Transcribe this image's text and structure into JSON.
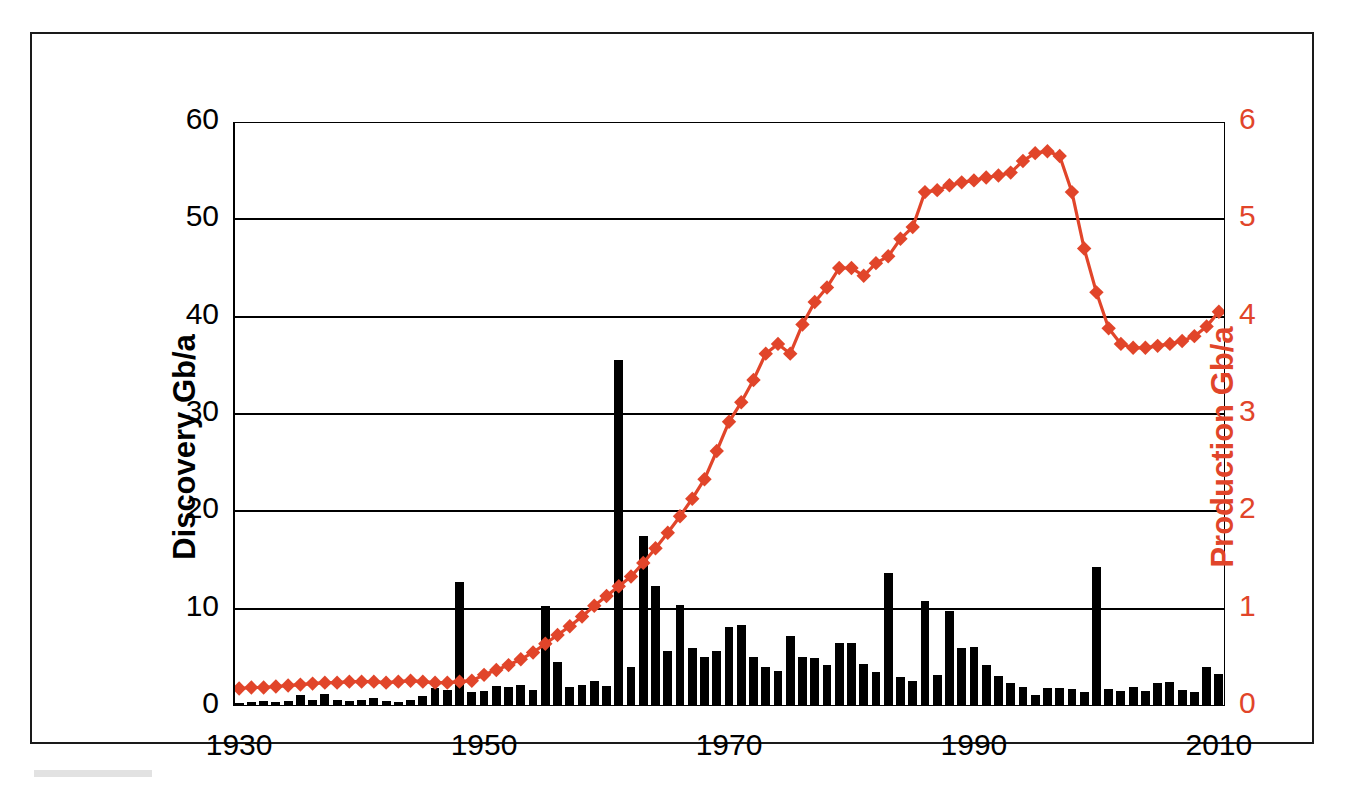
{
  "figure": {
    "title": "",
    "frame_color": "#1a1a1a",
    "background": "#ffffff"
  },
  "axes": {
    "left_title": "Discovery Gb/a",
    "right_title": "Production Gb/a",
    "left_color": "#000000",
    "right_color": "#e1452a",
    "left_ticks": [
      "0",
      "10",
      "20",
      "30",
      "40",
      "50",
      "60"
    ],
    "right_ticks": [
      "0",
      "1",
      "2",
      "3",
      "4",
      "5",
      "6"
    ],
    "x_ticks": [
      "1930",
      "1950",
      "1970",
      "1990",
      "2010"
    ],
    "x_minor_ticks": [
      "1940",
      "1960",
      "1980",
      "2000"
    ]
  },
  "chart_data": {
    "type": "bar",
    "title": "",
    "xlabel": "",
    "ylabel": "Discovery Gb/a",
    "y2label": "Production Gb/a",
    "xlim": [
      1930,
      2011
    ],
    "ylim": [
      0,
      60
    ],
    "y2lim": [
      0,
      6
    ],
    "grid": "horizontal",
    "legend": "none",
    "series": [
      {
        "name": "Discovery Gb/a",
        "type": "bar",
        "axis": "left",
        "color": "#000000",
        "x": [
          1930,
          1931,
          1932,
          1933,
          1934,
          1935,
          1936,
          1937,
          1938,
          1939,
          1940,
          1941,
          1942,
          1943,
          1944,
          1945,
          1946,
          1947,
          1948,
          1949,
          1950,
          1951,
          1952,
          1953,
          1954,
          1955,
          1956,
          1957,
          1958,
          1959,
          1960,
          1961,
          1962,
          1963,
          1964,
          1965,
          1966,
          1967,
          1968,
          1969,
          1970,
          1971,
          1972,
          1973,
          1974,
          1975,
          1976,
          1977,
          1978,
          1979,
          1980,
          1981,
          1982,
          1983,
          1984,
          1985,
          1986,
          1987,
          1988,
          1989,
          1990,
          1991,
          1992,
          1993,
          1994,
          1995,
          1996,
          1997,
          1998,
          1999,
          2000,
          2001,
          2002,
          2003,
          2004,
          2005,
          2006,
          2007,
          2008,
          2009,
          2010
        ],
        "values": [
          0.3,
          0.4,
          0.5,
          0.4,
          0.5,
          1.1,
          0.6,
          1.2,
          0.6,
          0.5,
          0.6,
          0.8,
          0.5,
          0.4,
          0.6,
          1.0,
          1.8,
          1.6,
          12.7,
          1.4,
          1.5,
          2.1,
          2.0,
          2.2,
          1.6,
          10.3,
          4.5,
          2.0,
          2.2,
          2.6,
          2.1,
          35.5,
          4.0,
          17.5,
          12.3,
          5.6,
          10.4,
          6.0,
          5.0,
          5.6,
          8.1,
          8.3,
          5.0,
          4.0,
          3.6,
          7.2,
          5.0,
          4.9,
          4.2,
          6.5,
          6.5,
          4.3,
          3.5,
          13.7,
          3.0,
          2.6,
          10.8,
          3.2,
          9.8,
          6.0,
          6.1,
          4.2,
          3.1,
          2.4,
          2.0,
          1.1,
          1.9,
          1.8,
          1.7,
          1.4,
          14.3,
          1.7,
          1.5,
          2.0,
          1.5,
          2.4,
          2.5,
          1.6,
          1.4,
          4.0,
          3.3
        ]
      },
      {
        "name": "Production Gb/a",
        "type": "line",
        "axis": "right",
        "color": "#e1452a",
        "marker": "diamond",
        "x": [
          1930,
          1931,
          1932,
          1933,
          1934,
          1935,
          1936,
          1937,
          1938,
          1939,
          1940,
          1941,
          1942,
          1943,
          1944,
          1945,
          1946,
          1947,
          1948,
          1949,
          1950,
          1951,
          1952,
          1953,
          1954,
          1955,
          1956,
          1957,
          1958,
          1959,
          1960,
          1961,
          1962,
          1963,
          1964,
          1965,
          1966,
          1967,
          1968,
          1969,
          1970,
          1971,
          1972,
          1973,
          1974,
          1975,
          1976,
          1977,
          1978,
          1979,
          1980,
          1981,
          1982,
          1983,
          1984,
          1985,
          1986,
          1987,
          1988,
          1989,
          1990,
          1991,
          1992,
          1993,
          1994,
          1995,
          1996,
          1997,
          1998,
          1999,
          2000,
          2001,
          2002,
          2003,
          2004,
          2005,
          2006,
          2007,
          2008,
          2009,
          2010
        ],
        "values": [
          0.18,
          0.19,
          0.19,
          0.2,
          0.21,
          0.22,
          0.23,
          0.24,
          0.24,
          0.25,
          0.25,
          0.25,
          0.24,
          0.25,
          0.26,
          0.25,
          0.24,
          0.24,
          0.25,
          0.26,
          0.32,
          0.37,
          0.42,
          0.48,
          0.55,
          0.64,
          0.73,
          0.82,
          0.92,
          1.03,
          1.13,
          1.23,
          1.33,
          1.47,
          1.62,
          1.78,
          1.95,
          2.13,
          2.33,
          2.62,
          2.92,
          3.12,
          3.35,
          3.62,
          3.72,
          3.62,
          3.92,
          4.15,
          4.3,
          4.5,
          4.5,
          4.42,
          4.55,
          4.62,
          4.8,
          4.92,
          5.28,
          5.3,
          5.35,
          5.38,
          5.4,
          5.43,
          5.45,
          5.48,
          5.6,
          5.68,
          5.7,
          5.65,
          5.28,
          4.7,
          4.25,
          3.88,
          3.72,
          3.68,
          3.68,
          3.7,
          3.72,
          3.75,
          3.8,
          3.9,
          4.05
        ]
      }
    ]
  }
}
